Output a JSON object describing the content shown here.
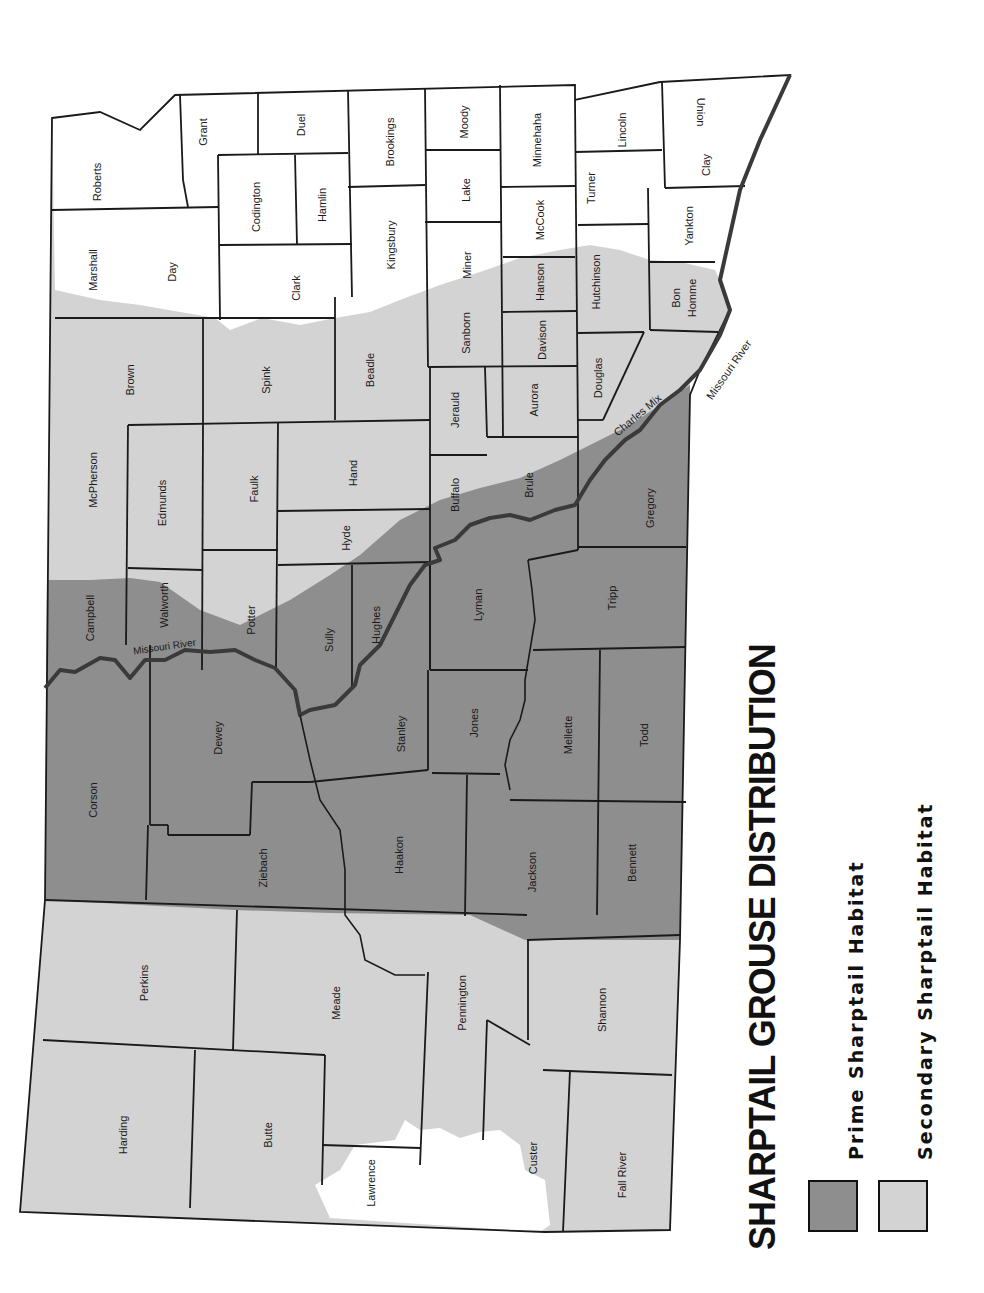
{
  "title": "SHARPTAIL GROUSE DISTRIBUTION",
  "legend": [
    {
      "label": "Prime Sharptail Habitat",
      "color": "#8e8e8e"
    },
    {
      "label": "Secondary Sharptail Habitat",
      "color": "#d3d3d3"
    }
  ],
  "colors": {
    "prime": "#8e8e8e",
    "secondary": "#d3d3d3",
    "none": "#ffffff",
    "border": "#1a1a1a",
    "river": "#3a3a3a"
  },
  "orientation": "map rotated 90 degrees counter-clockwise (north at left)",
  "rivers": [
    {
      "label": "Missouri River",
      "position": "near Walworth/Campbell"
    },
    {
      "label": "Missouri River",
      "position": "near Bon Homme/Charles Mix"
    }
  ],
  "counties": {
    "roberts": "Roberts",
    "grant": "Grant",
    "duel": "Duel",
    "brookings": "Brookings",
    "moody": "Moody",
    "minnehaha": "Minnehaha",
    "lincoln": "Lincoln",
    "union": "Union",
    "marshall": "Marshall",
    "day": "Day",
    "codington": "Codington",
    "hamlin": "Hamlin",
    "clark": "Clark",
    "kingsbury": "Kingsbury",
    "lake": "Lake",
    "mccook": "McCook",
    "turner": "Turner",
    "clay": "Clay",
    "miner": "Miner",
    "hanson": "Hanson",
    "hutchinson": "Hutchinson",
    "yankton": "Yankton",
    "bon": "Bon",
    "homme": "Homme",
    "brown": "Brown",
    "spink": "Spink",
    "beadle": "Beadle",
    "sanborn": "Sanborn",
    "davison": "Davison",
    "douglas": "Douglas",
    "mcpherson": "McPherson",
    "edmunds": "Edmunds",
    "faulk": "Faulk",
    "hand": "Hand",
    "jerauld": "Jerauld",
    "aurora": "Aurora",
    "charles_mix": "Charles Mix",
    "hyde": "Hyde",
    "buffalo": "Buffalo",
    "brule": "Brule",
    "gregory": "Gregory",
    "campbell": "Campbell",
    "walworth": "Walworth",
    "potter": "Potter",
    "sully": "Sully",
    "hughes": "Hughes",
    "lyman": "Lyman",
    "tripp": "Tripp",
    "corson": "Corson",
    "dewey": "Dewey",
    "stanley": "Stanley",
    "jones": "Jones",
    "mellette": "Mellette",
    "todd": "Todd",
    "ziebach": "Ziebach",
    "haakon": "Haakon",
    "jackson": "Jackson",
    "bennett": "Bennett",
    "perkins": "Perkins",
    "meade": "Meade",
    "pennington": "Pennington",
    "shannon": "Shannon",
    "harding": "Harding",
    "butte": "Butte",
    "lawrence": "Lawrence",
    "custer": "Custer",
    "fall_river": "Fall River"
  }
}
